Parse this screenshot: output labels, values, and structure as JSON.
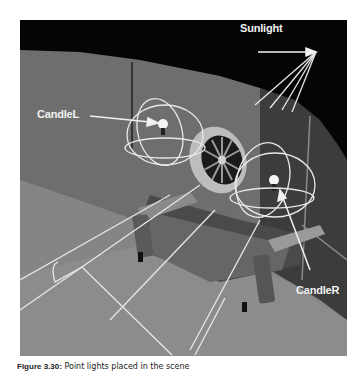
{
  "figure": {
    "labels": {
      "sunlight": "Sunlight",
      "candle_left": "CandleL",
      "candle_right": "CandleR"
    },
    "caption": {
      "number": "Figure 3.30:",
      "text": "Point lights placed in the scene"
    },
    "colors": {
      "sky": "#050505",
      "wall": "#6d6d6d",
      "wall_dark": "#3a3a3a",
      "floor": "#8a8a8a",
      "wireframe": "#e8e8e8"
    }
  }
}
